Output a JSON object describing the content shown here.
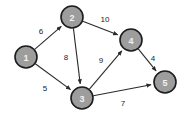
{
  "chart_data": {
    "type": "diagram",
    "diagram_kind": "directed-weighted-graph",
    "title": "",
    "background_color": "#ffffff",
    "node_fill_color": "#9d9d9d",
    "node_stroke_color": "#1c1c1c",
    "node_label_color": "#f2f2f2",
    "edge_color": "#2b2b2b",
    "weight_label_color": "#1c1c1c",
    "nodes": [
      {
        "id": "1",
        "label": "1",
        "cx": 26,
        "cy": 57,
        "r": 11
      },
      {
        "id": "2",
        "label": "2",
        "cx": 72,
        "cy": 17,
        "r": 11
      },
      {
        "id": "3",
        "label": "3",
        "cx": 82,
        "cy": 98,
        "r": 11
      },
      {
        "id": "4",
        "label": "4",
        "cx": 131,
        "cy": 40,
        "r": 11
      },
      {
        "id": "5",
        "label": "5",
        "cx": 165,
        "cy": 82,
        "r": 11
      }
    ],
    "edges": [
      {
        "from": "1",
        "to": "2",
        "weight": "6",
        "label_x": 41,
        "label_y": 31,
        "directed": true
      },
      {
        "from": "1",
        "to": "3",
        "weight": "5",
        "label_x": 45,
        "label_y": 88,
        "directed": true
      },
      {
        "from": "2",
        "to": "4",
        "weight": "10",
        "label_x": 105,
        "label_y": 19,
        "directed": true
      },
      {
        "from": "2",
        "to": "3",
        "weight": "8",
        "label_x": 66,
        "label_y": 57,
        "directed": true
      },
      {
        "from": "3",
        "to": "4",
        "weight": "9",
        "label_x": 101,
        "label_y": 60,
        "directed": true
      },
      {
        "from": "3",
        "to": "5",
        "weight": "7",
        "label_x": 123,
        "label_y": 103,
        "directed": true
      },
      {
        "from": "4",
        "to": "5",
        "weight": "4",
        "label_x": 153,
        "label_y": 58,
        "directed": true
      }
    ],
    "node_count": 5,
    "edge_count": 7,
    "weights": [
      6,
      5,
      10,
      8,
      9,
      7,
      4
    ]
  }
}
